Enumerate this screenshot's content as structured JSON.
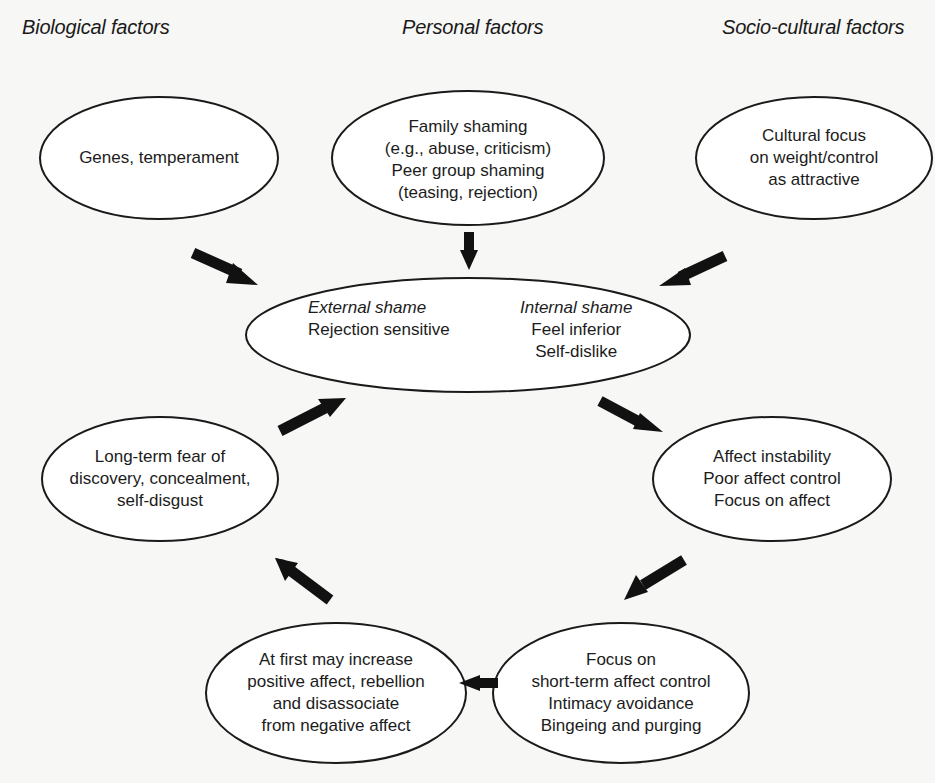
{
  "headings": {
    "biological": "Biological factors",
    "personal": "Personal factors",
    "socio_cultural": "Socio-cultural factors"
  },
  "nodes": {
    "genes": {
      "lines": [
        "Genes, temperament"
      ]
    },
    "personal": {
      "lines": [
        "Family shaming",
        "(e.g., abuse, criticism)",
        "Peer group shaming",
        "(teasing, rejection)"
      ]
    },
    "cultural": {
      "lines": [
        "Cultural focus",
        "on weight/control",
        "as attractive"
      ]
    },
    "shame": {
      "external_title": "External shame",
      "external_lines": [
        "Rejection sensitive"
      ],
      "internal_title": "Internal shame",
      "internal_lines": [
        "Feel inferior",
        "Self-dislike"
      ]
    },
    "long_term": {
      "lines": [
        "Long-term fear of",
        "discovery, concealment,",
        "self-disgust"
      ]
    },
    "affect": {
      "lines": [
        "Affect instability",
        "Poor affect control",
        "Focus on affect"
      ]
    },
    "at_first": {
      "lines": [
        "At first may increase",
        "positive affect, rebellion",
        "and disassociate",
        "from negative affect"
      ]
    },
    "focus_short": {
      "lines": [
        "Focus on",
        "short-term affect control",
        "Intimacy avoidance",
        "Bingeing and purging"
      ]
    }
  },
  "arrows": [
    {
      "from": "genes",
      "to": "shame",
      "icon": "arrow-down-right"
    },
    {
      "from": "personal",
      "to": "shame",
      "icon": "arrow-down"
    },
    {
      "from": "cultural",
      "to": "shame",
      "icon": "arrow-down-left"
    },
    {
      "from": "shame",
      "to": "affect",
      "icon": "arrow-down-right"
    },
    {
      "from": "affect",
      "to": "focus_short",
      "icon": "arrow-down-left"
    },
    {
      "from": "focus_short",
      "to": "at_first",
      "icon": "arrow-left"
    },
    {
      "from": "at_first",
      "to": "long_term",
      "icon": "arrow-up-left"
    },
    {
      "from": "long_term",
      "to": "shame",
      "icon": "arrow-up-right"
    }
  ],
  "colors": {
    "background": "#f7f7f5",
    "stroke": "#1a1a1a",
    "ellipse_fill": "#ffffff",
    "text": "#1c1c1c"
  }
}
